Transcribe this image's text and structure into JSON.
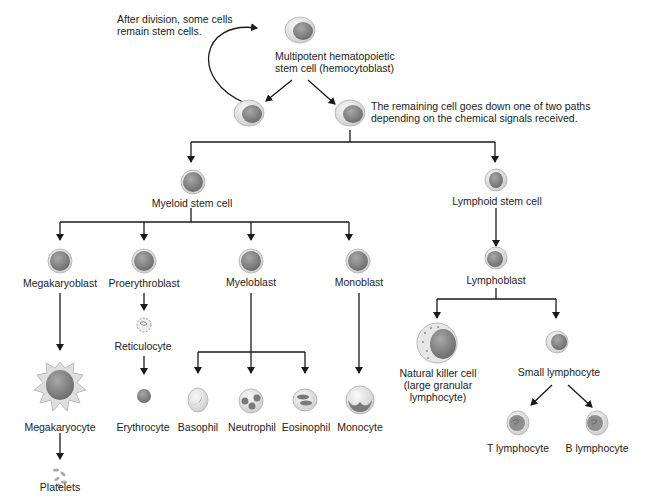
{
  "diagram": {
    "type": "hematopoiesis-lineage-tree",
    "annotations": {
      "self_renewal": "After division, some cells remain stem cells.",
      "differentiation": "The remaining cell goes down one of two paths depending on the chemical signals received."
    },
    "stem_cell": {
      "line1": "Multipotent hematopoietic",
      "line2": "stem cell (hemocytoblast)"
    },
    "myeloid": {
      "label": "Myeloid stem cell",
      "blasts": {
        "megakaryoblast": "Megakaryoblast",
        "proerythroblast": "Proerythroblast",
        "myeloblast": "Myeloblast",
        "monoblast": "Monoblast"
      },
      "intermediate": {
        "reticulocyte": "Reticulocyte"
      },
      "mature": {
        "megakaryocyte": "Megakaryocyte",
        "platelets": "Platelets",
        "erythrocyte": "Erythrocyte",
        "basophil": "Basophil",
        "neutrophil": "Neutrophil",
        "eosinophil": "Eosinophil",
        "monocyte": "Monocyte"
      }
    },
    "lymphoid": {
      "label": "Lymphoid stem cell",
      "lymphoblast": "Lymphoblast",
      "nk": {
        "line1": "Natural killer cell",
        "line2": "(large granular",
        "line3": "lymphocyte)"
      },
      "small_lymphocyte": "Small lymphocyte",
      "t_lymphocyte": "T lymphocyte",
      "b_lymphocyte": "B lymphocyte"
    },
    "colors": {
      "line": "#1a1a1a",
      "cell_body": "#e4e4e4",
      "nucleus": "#8a8a8a",
      "text": "#222222"
    }
  }
}
